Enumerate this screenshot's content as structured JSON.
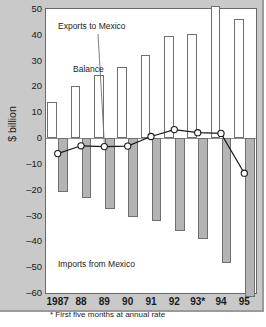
{
  "chart_data": {
    "type": "bar",
    "title": "",
    "xlabel": "",
    "ylabel": "$ billion",
    "ylim": [
      -60,
      50
    ],
    "grid": false,
    "legend_position": "none",
    "categories": [
      "1987",
      "88",
      "89",
      "90",
      "91",
      "92",
      "93*",
      "94",
      "95"
    ],
    "ytick_labels": [
      "50",
      "40",
      "30",
      "20",
      "10",
      "0",
      "-10",
      "-20",
      "-30",
      "-40",
      "-50",
      "-60"
    ],
    "ytick_values": [
      50,
      40,
      30,
      20,
      10,
      0,
      -10,
      -20,
      -30,
      -40,
      -50,
      -60
    ],
    "series": [
      {
        "name": "Exports to Mexico",
        "type": "bar",
        "values": [
          14,
          20.3,
          24.3,
          27.5,
          32.3,
          39.5,
          40.4,
          51,
          46
        ]
      },
      {
        "name": "Imports from Mexico",
        "type": "bar",
        "values": [
          -20.8,
          -23.4,
          -27.5,
          -30.4,
          -32,
          -36,
          -39,
          -48.2,
          -61.7
        ]
      },
      {
        "name": "Balance",
        "type": "line",
        "values": [
          -6,
          -3,
          -3.3,
          -3.1,
          0.6,
          3.3,
          2.1,
          1.8,
          -13.6
        ]
      }
    ],
    "annotations": [
      {
        "name": "exports-label",
        "text": "Exports to Mexico"
      },
      {
        "name": "balance-label",
        "text": "Balance"
      },
      {
        "name": "imports-label",
        "text": "Imports from Mexico"
      }
    ],
    "footnote": "* First five months at annual rate",
    "colors": {
      "export_fill": "#ffffff",
      "import_fill": "#b4b4b4",
      "bar_stroke": "#6f6f6f",
      "line": "#1a1a1a",
      "marker_fill": "#ffffff",
      "panel_bg": "#c9c9c9",
      "plot_bg": "#ffffff"
    }
  }
}
